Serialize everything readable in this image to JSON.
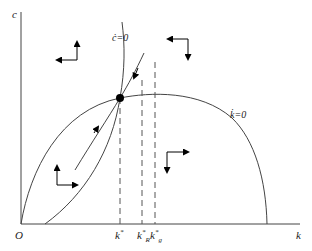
{
  "diagram": {
    "type": "phase-diagram",
    "axes": {
      "y_label": "c",
      "x_label": "k",
      "origin_label": "O"
    },
    "curves": {
      "c_dot_zero": "ċ=0",
      "k_dot_zero": "k̇=0"
    },
    "x_ticks": [
      {
        "base": "k",
        "sup": "*",
        "sub": ""
      },
      {
        "base": "k",
        "sup": "*",
        "sub": "R"
      },
      {
        "base": "k",
        "sup": "*",
        "sub": "g"
      }
    ],
    "colors": {
      "line": "#333333",
      "dashed": "#555555",
      "point": "#000000"
    }
  }
}
